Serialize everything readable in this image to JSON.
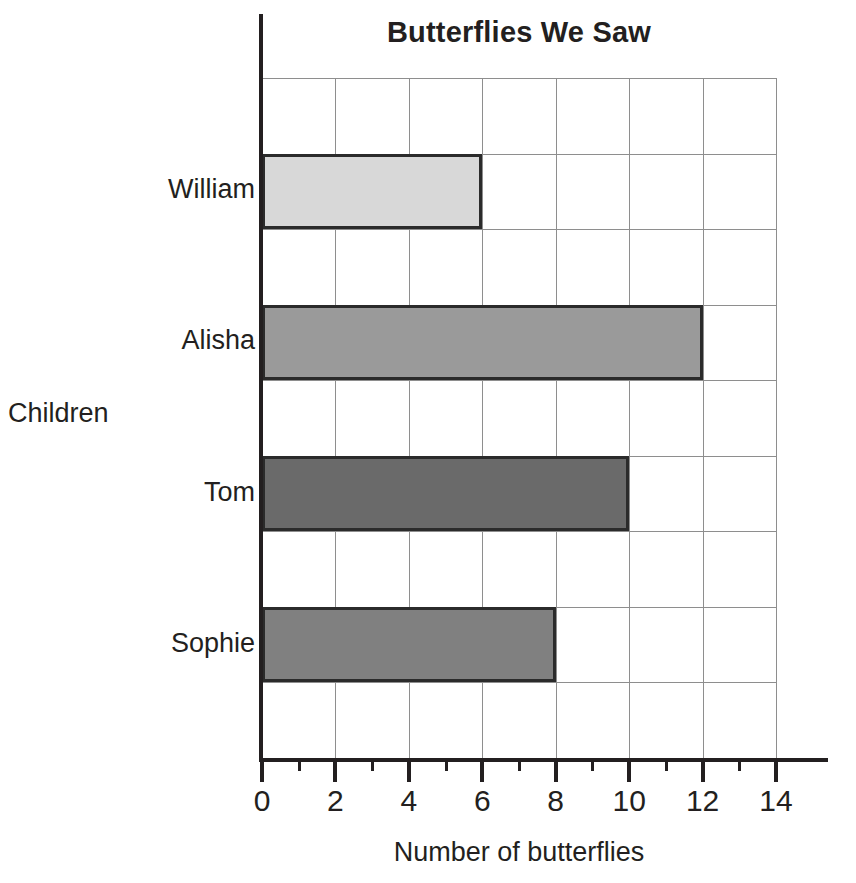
{
  "chart_data": {
    "type": "bar",
    "orientation": "horizontal",
    "title": "Butterflies We Saw",
    "xlabel": "Number of butterflies",
    "ylabel": "Children",
    "categories": [
      "Sophie",
      "Tom",
      "Alisha",
      "William"
    ],
    "values": [
      8,
      10,
      12,
      6
    ],
    "bar_colors": [
      "#808080",
      "#6a6a6a",
      "#9a9a9a",
      "#d8d8d8"
    ],
    "bar_border_color": "#2b2b2b",
    "xlim": [
      0,
      14
    ],
    "xticks": [
      0,
      2,
      4,
      6,
      8,
      10,
      12,
      14
    ],
    "xtick_labels": [
      "0",
      "2",
      "4",
      "6",
      "8",
      "10",
      "12",
      "14"
    ],
    "minor_xticks": [
      1,
      3,
      5,
      7,
      9,
      11,
      13
    ],
    "grid": true,
    "grid_color": "#8e8e8e",
    "legend": "none",
    "axis_color": "#231f20"
  },
  "bars": [
    {
      "name": "William",
      "value": 6,
      "color": "#d8d8d8",
      "row": 1
    },
    {
      "name": "Alisha",
      "value": 12,
      "color": "#9a9a9a",
      "row": 3
    },
    {
      "name": "Tom",
      "value": 10,
      "color": "#6a6a6a",
      "row": 5
    },
    {
      "name": "Sophie",
      "value": 8,
      "color": "#808080",
      "row": 7
    }
  ],
  "axis": {
    "x_title": "Number of butterflies",
    "y_title": "Children",
    "x_tick_labels": [
      "0",
      "2",
      "4",
      "6",
      "8",
      "10",
      "12",
      "14"
    ]
  },
  "title": "Butterflies We Saw"
}
